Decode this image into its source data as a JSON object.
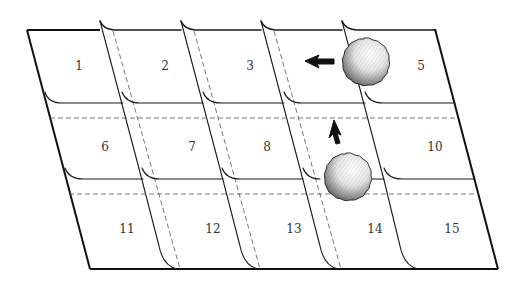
{
  "diagram": {
    "rows": 3,
    "columns": 5,
    "cells": [
      {
        "label": "1",
        "row": 0,
        "col": 0
      },
      {
        "label": "2",
        "row": 0,
        "col": 1
      },
      {
        "label": "3",
        "row": 0,
        "col": 2
      },
      {
        "label": "5",
        "row": 0,
        "col": 4
      },
      {
        "label": "6",
        "row": 1,
        "col": 0
      },
      {
        "label": "7",
        "row": 1,
        "col": 1
      },
      {
        "label": "8",
        "row": 1,
        "col": 2
      },
      {
        "label": "10",
        "row": 1,
        "col": 4
      },
      {
        "label": "11",
        "row": 2,
        "col": 0
      },
      {
        "label": "12",
        "row": 2,
        "col": 1
      },
      {
        "label": "13",
        "row": 2,
        "col": 2
      },
      {
        "label": "14",
        "row": 2,
        "col": 3
      },
      {
        "label": "15",
        "row": 2,
        "col": 4
      }
    ],
    "hidden_cells": [
      "4",
      "9"
    ],
    "objects": [
      {
        "name": "ball-upper",
        "covers_cell": "4"
      },
      {
        "name": "ball-lower",
        "covers_cell": "9"
      }
    ],
    "arrows": [
      {
        "name": "arrow-left",
        "direction": "left"
      },
      {
        "name": "arrow-up",
        "direction": "up"
      }
    ],
    "colors": {
      "line": "#111111",
      "dashed": "#555555",
      "text": "#333333",
      "background": "#ffffff"
    }
  }
}
